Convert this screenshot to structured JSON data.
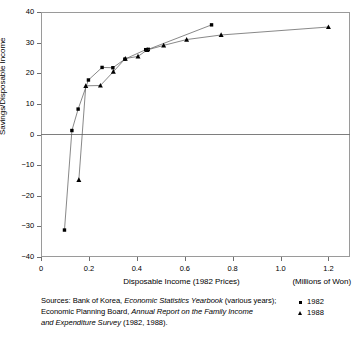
{
  "chart_data": {
    "type": "scatter",
    "title": "",
    "xlabel": "Disposable Income (1982 Prices)",
    "x_units": "(Millions of Won)",
    "ylabel": "Savings/Disposable Income",
    "xlim": [
      0,
      1.29
    ],
    "ylim": [
      -40,
      40
    ],
    "xticks": [
      0,
      0.2,
      0.4,
      0.6,
      0.8,
      1.0,
      1.2
    ],
    "xtick_labels": [
      "0",
      "0.2",
      "0.4",
      "0.6",
      "0.8",
      "1.0",
      "1.2"
    ],
    "yticks": [
      -40,
      -30,
      -20,
      -10,
      0,
      10,
      20,
      30,
      40
    ],
    "ytick_labels": [
      "−40",
      "−30",
      "−20",
      "−10",
      "0",
      "10",
      "20",
      "30",
      "40"
    ],
    "grid": false,
    "zero_line": true,
    "legend_position": "bottom-right",
    "series": [
      {
        "name": "1982",
        "marker": "square",
        "points": [
          {
            "x": 0.098,
            "y": -31.2
          },
          {
            "x": 0.129,
            "y": 1.3
          },
          {
            "x": 0.155,
            "y": 8.3
          },
          {
            "x": 0.198,
            "y": 17.8
          },
          {
            "x": 0.255,
            "y": 21.9
          },
          {
            "x": 0.3,
            "y": 21.8
          },
          {
            "x": 0.35,
            "y": 24.6
          },
          {
            "x": 0.437,
            "y": 27.7
          },
          {
            "x": 0.448,
            "y": 27.8
          },
          {
            "x": 0.712,
            "y": 35.8
          }
        ]
      },
      {
        "name": "1988",
        "marker": "triangle",
        "points": [
          {
            "x": 0.158,
            "y": -14.8
          },
          {
            "x": 0.187,
            "y": 15.9
          },
          {
            "x": 0.248,
            "y": 16.0
          },
          {
            "x": 0.302,
            "y": 20.5
          },
          {
            "x": 0.352,
            "y": 24.8
          },
          {
            "x": 0.405,
            "y": 25.5
          },
          {
            "x": 0.443,
            "y": 27.6
          },
          {
            "x": 0.512,
            "y": 29.1
          },
          {
            "x": 0.608,
            "y": 31.0
          },
          {
            "x": 0.752,
            "y": 32.5
          },
          {
            "x": 1.2,
            "y": 35.1
          }
        ]
      }
    ]
  },
  "legend": {
    "items": [
      {
        "label": "1982",
        "marker": "square"
      },
      {
        "label": "1988",
        "marker": "triangle"
      }
    ]
  },
  "footer": {
    "line1_a": "Sources: Bank of Korea, ",
    "line1_b": "Economic Statistics Yearbook",
    "line1_c": " (various years);",
    "line2_a": "Economic Planning Board, ",
    "line2_b": "Annual Report on the Family Income",
    "line3_a": "and Expenditure Survey",
    "line3_b": " (1982, 1988)."
  }
}
